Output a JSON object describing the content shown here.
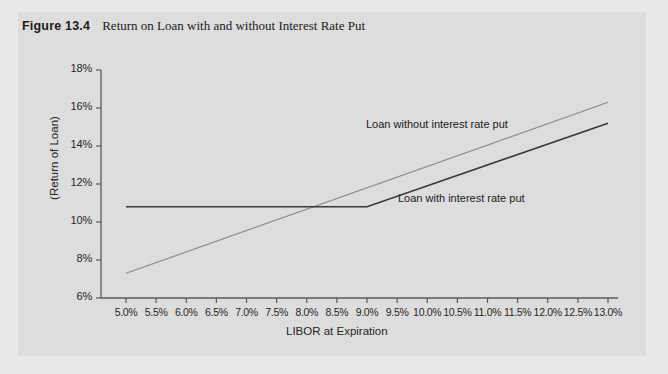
{
  "figure": {
    "number_label": "Figure 13.4",
    "caption": "Return on Loan with and without Interest Rate Put"
  },
  "chart_data": {
    "type": "line",
    "title": "Return on Loan with and without Interest Rate Put",
    "xlabel": "LIBOR at Expiration",
    "ylabel": "(Return of Loan)",
    "xlim": [
      5.0,
      13.0
    ],
    "ylim": [
      6,
      18
    ],
    "grid": false,
    "legend_position": "inline-annotations",
    "x_tick_labels": [
      "5.0%",
      "5.5%",
      "6.0%",
      "6.5%",
      "7.0%",
      "7.5%",
      "8.0%",
      "8.5%",
      "9.0%",
      "9.5%",
      "10.0%",
      "10.5%",
      "11.0%",
      "11.5%",
      "12.0%",
      "12.5%",
      "13.0%"
    ],
    "x_tick_values": [
      5.0,
      5.5,
      6.0,
      6.5,
      7.0,
      7.5,
      8.0,
      8.5,
      9.0,
      9.5,
      10.0,
      10.5,
      11.0,
      11.5,
      12.0,
      12.5,
      13.0
    ],
    "y_tick_labels": [
      "6%",
      "8%",
      "10%",
      "12%",
      "14%",
      "16%",
      "18%"
    ],
    "y_tick_values": [
      6,
      8,
      10,
      12,
      14,
      16,
      18
    ],
    "series": [
      {
        "name": "Loan without interest rate put",
        "color": "#8c8c8c",
        "width": 1.2,
        "x": [
          5.0,
          13.0
        ],
        "values": [
          7.3,
          16.3
        ]
      },
      {
        "name": "Loan with interest rate put",
        "color": "#3a3a3a",
        "width": 1.6,
        "x": [
          5.0,
          9.0,
          13.0
        ],
        "values": [
          10.8,
          10.8,
          15.2
        ]
      }
    ],
    "annotations": [
      {
        "text": "Loan without interest rate put",
        "x": 10.0,
        "y": 14.3
      },
      {
        "text": "Loan with interest rate put",
        "x": 10.6,
        "y": 11.6
      }
    ]
  },
  "colors": {
    "page_background": "#e9e9e9",
    "panel_background": "#dddddd",
    "axis": "#5a5a5a",
    "series_without_put": "#8c8c8c",
    "series_with_put": "#3a3a3a",
    "text": "#1b1b1b"
  }
}
